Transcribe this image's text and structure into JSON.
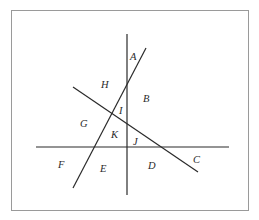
{
  "diagram": {
    "type": "intersecting-lines-regions",
    "frame": {
      "x": 11,
      "y": 10,
      "width": 238,
      "height": 201,
      "border_color": "#9a9a9a"
    },
    "line_color": "#2a2a2a",
    "lines": [
      {
        "id": "vertical",
        "x1": 127,
        "y1": 34,
        "x2": 127,
        "y2": 195
      },
      {
        "id": "horizontal",
        "x1": 36,
        "y1": 147,
        "x2": 229,
        "y2": 147
      },
      {
        "id": "steep-diagonal",
        "x1": 146,
        "y1": 48,
        "x2": 73,
        "y2": 188
      },
      {
        "id": "shallow-diagonal",
        "x1": 73,
        "y1": 87,
        "x2": 198,
        "y2": 172
      }
    ],
    "regions": [
      {
        "label": "A",
        "x": 130,
        "y": 60
      },
      {
        "label": "B",
        "x": 143,
        "y": 102
      },
      {
        "label": "C",
        "x": 193,
        "y": 163
      },
      {
        "label": "D",
        "x": 148,
        "y": 169
      },
      {
        "label": "E",
        "x": 100,
        "y": 172
      },
      {
        "label": "F",
        "x": 58,
        "y": 168
      },
      {
        "label": "G",
        "x": 80,
        "y": 127
      },
      {
        "label": "H",
        "x": 101,
        "y": 88
      },
      {
        "label": "I",
        "x": 119,
        "y": 114
      },
      {
        "label": "J",
        "x": 133,
        "y": 145
      },
      {
        "label": "K",
        "x": 111,
        "y": 138
      }
    ]
  }
}
